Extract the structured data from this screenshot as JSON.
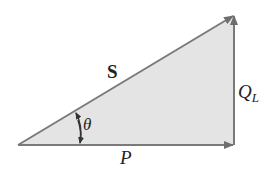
{
  "diagram": {
    "colors": {
      "fill": "#e4e4e4",
      "stroke": "#7a7a7a",
      "arrow": "#6e6e6e",
      "text": "#222222"
    },
    "vertices": {
      "origin": [
        18,
        145
      ],
      "right": [
        234,
        145
      ],
      "top": [
        234,
        15
      ]
    },
    "labels": {
      "hypotenuse": "S",
      "horizontal": "P",
      "vertical_main": "Q",
      "vertical_sub": "L",
      "angle": "θ"
    }
  }
}
